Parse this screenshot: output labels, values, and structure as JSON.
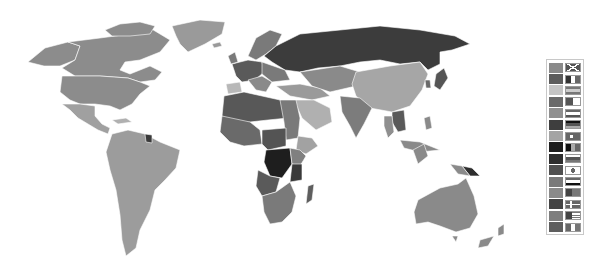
{
  "map": {
    "type": "world-choropleth",
    "style": "grayscale",
    "regions": [
      {
        "name": "Canada",
        "shade": "#8c8c8c"
      },
      {
        "name": "United States",
        "shade": "#8c8c8c"
      },
      {
        "name": "Alaska",
        "shade": "#8c8c8c"
      },
      {
        "name": "Greenland",
        "shade": "#9a9a9a"
      },
      {
        "name": "Mexico & Central America",
        "shade": "#a0a0a0"
      },
      {
        "name": "South America",
        "shade": "#9c9c9c"
      },
      {
        "name": "Guiana",
        "shade": "#3a3a3a"
      },
      {
        "name": "Western Europe",
        "shade": "#5a5a5a"
      },
      {
        "name": "Scandinavia",
        "shade": "#7a7a7a"
      },
      {
        "name": "Russia",
        "shade": "#3c3c3c"
      },
      {
        "name": "Middle East",
        "shade": "#9a9a9a"
      },
      {
        "name": "Arabia",
        "shade": "#b0b0b0"
      },
      {
        "name": "Central Asia",
        "shade": "#8a8a8a"
      },
      {
        "name": "China & Mongolia",
        "shade": "#a6a6a6"
      },
      {
        "name": "India",
        "shade": "#7c7c7c"
      },
      {
        "name": "Southeast Asia",
        "shade": "#5a5a5a"
      },
      {
        "name": "Indochina",
        "shade": "#8f8f8f"
      },
      {
        "name": "Japan",
        "shade": "#555555"
      },
      {
        "name": "North Africa",
        "shade": "#585858"
      },
      {
        "name": "West Africa",
        "shade": "#6a6a6a"
      },
      {
        "name": "East Africa",
        "shade": "#808080"
      },
      {
        "name": "Horn of Africa",
        "shade": "#a2a2a2"
      },
      {
        "name": "Central Africa (DRC)",
        "shade": "#1e1e1e"
      },
      {
        "name": "Tanzania",
        "shade": "#3a3a3a"
      },
      {
        "name": "Angola",
        "shade": "#5a5a5a"
      },
      {
        "name": "Southern Africa",
        "shade": "#7a7a7a"
      },
      {
        "name": "Madagascar",
        "shade": "#5e5e5e"
      },
      {
        "name": "Indonesia",
        "shade": "#8a8a8a"
      },
      {
        "name": "Papua New Guinea",
        "shade": "#2e2e2e"
      },
      {
        "name": "Australia",
        "shade": "#8a8a8a"
      },
      {
        "name": "New Zealand",
        "shade": "#8a8a8a"
      }
    ]
  },
  "legend": {
    "entries": [
      {
        "swatch": "#8a8a8a",
        "flag": "united-kingdom-flag"
      },
      {
        "swatch": "#5c5c5c",
        "flag": "france-flag"
      },
      {
        "swatch": "#c4c4c4",
        "flag": "spain-flag"
      },
      {
        "swatch": "#6a6a6a",
        "flag": "algeria-flag"
      },
      {
        "swatch": "#909090",
        "flag": "netherlands-flag"
      },
      {
        "swatch": "#3e3e3e",
        "flag": "germany-flag"
      },
      {
        "swatch": "#a4a4a4",
        "flag": "turkey-flag"
      },
      {
        "swatch": "#1e1e1e",
        "flag": "belgium-flag"
      },
      {
        "swatch": "#2e2e2e",
        "flag": "russia-flag"
      },
      {
        "swatch": "#505050",
        "flag": "japan-flag"
      },
      {
        "swatch": "#7a7a7a",
        "flag": "egypt-flag"
      },
      {
        "swatch": "#8a8a8a",
        "flag": "portugal-flag"
      },
      {
        "swatch": "#444444",
        "flag": "denmark-flag"
      },
      {
        "swatch": "#7e7e7e",
        "flag": "united-states-flag"
      },
      {
        "swatch": "#5e5e5e",
        "flag": "italy-flag"
      }
    ]
  }
}
